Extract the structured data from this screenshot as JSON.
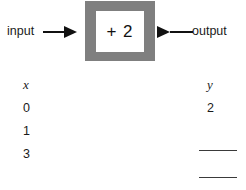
{
  "diagram": {
    "input_label": "input",
    "output_label": "output",
    "machine_rule": "+ 2",
    "box_color": "#7f7f7f",
    "window_color": "#ffffff",
    "arrow_color": "#111111",
    "input_arrow_icon": "arrow-right-icon",
    "output_arrow_icon": "arrow-right-icon"
  },
  "table": {
    "headers": {
      "x": "x",
      "y": "y"
    },
    "rows": [
      {
        "x": "0",
        "y": "2",
        "y_blank": false
      },
      {
        "x": "1",
        "y": "",
        "y_blank": true
      },
      {
        "x": "3",
        "y": "",
        "y_blank": true
      }
    ]
  },
  "chart_data": {
    "type": "table",
    "title": "",
    "xlabel": "x",
    "ylabel": "y",
    "categories": [
      "0",
      "1",
      "3"
    ],
    "series": [
      {
        "name": "y",
        "values": [
          "2",
          "",
          ""
        ]
      }
    ],
    "rule": "+ 2"
  }
}
